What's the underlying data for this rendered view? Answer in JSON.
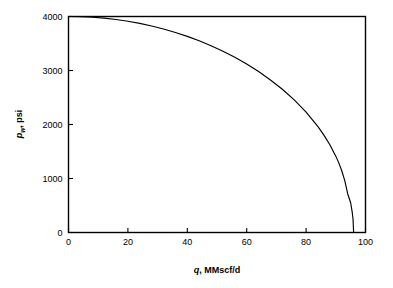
{
  "figure": {
    "background_color": "#ffffff",
    "frame_color": "#000000",
    "curve_color": "#000000"
  },
  "axes": {
    "x": {
      "title_symbol": "q",
      "title_rest": ", MMscf/d",
      "title_full": "q, MMscf/d",
      "tick_labels": [
        "0",
        "20",
        "40",
        "60",
        "80",
        "100"
      ],
      "tick_values": [
        0,
        20,
        40,
        60,
        80,
        100
      ],
      "min": 0,
      "max": 100
    },
    "y": {
      "title_symbol": "p",
      "title_subscript": "w",
      "title_rest": ", psi",
      "title_full": "pw, psi",
      "tick_labels": [
        "0",
        "1000",
        "2000",
        "3000",
        "4000"
      ],
      "tick_values": [
        0,
        1000,
        2000,
        3000,
        4000
      ],
      "min": 0,
      "max": 4000
    }
  },
  "chart_data": {
    "type": "line",
    "title": "",
    "xlabel": "q, MMscf/d",
    "ylabel": "pw, psi",
    "xlim": [
      0,
      100
    ],
    "ylim": [
      0,
      4000
    ],
    "grid": false,
    "legend": "none",
    "series": [
      {
        "name": "IPR curve",
        "color": "#000000",
        "x": [
          0,
          4,
          8,
          12,
          16,
          20,
          24,
          28,
          32,
          36,
          40,
          44,
          48,
          52,
          56,
          60,
          64,
          68,
          72,
          76,
          80,
          84,
          86,
          88,
          90,
          91,
          92,
          93,
          94,
          95,
          95.5,
          95.8,
          96
        ],
        "y": [
          4000,
          3997,
          3986,
          3969,
          3944,
          3912,
          3872,
          3824,
          3769,
          3705,
          3632,
          3550,
          3459,
          3357,
          3244,
          3119,
          2980,
          2825,
          2652,
          2455,
          2229,
          1961,
          1804,
          1626,
          1414,
          1289,
          1143,
          964,
          718,
          551,
          386,
          251,
          0
        ]
      }
    ],
    "annotations": []
  }
}
